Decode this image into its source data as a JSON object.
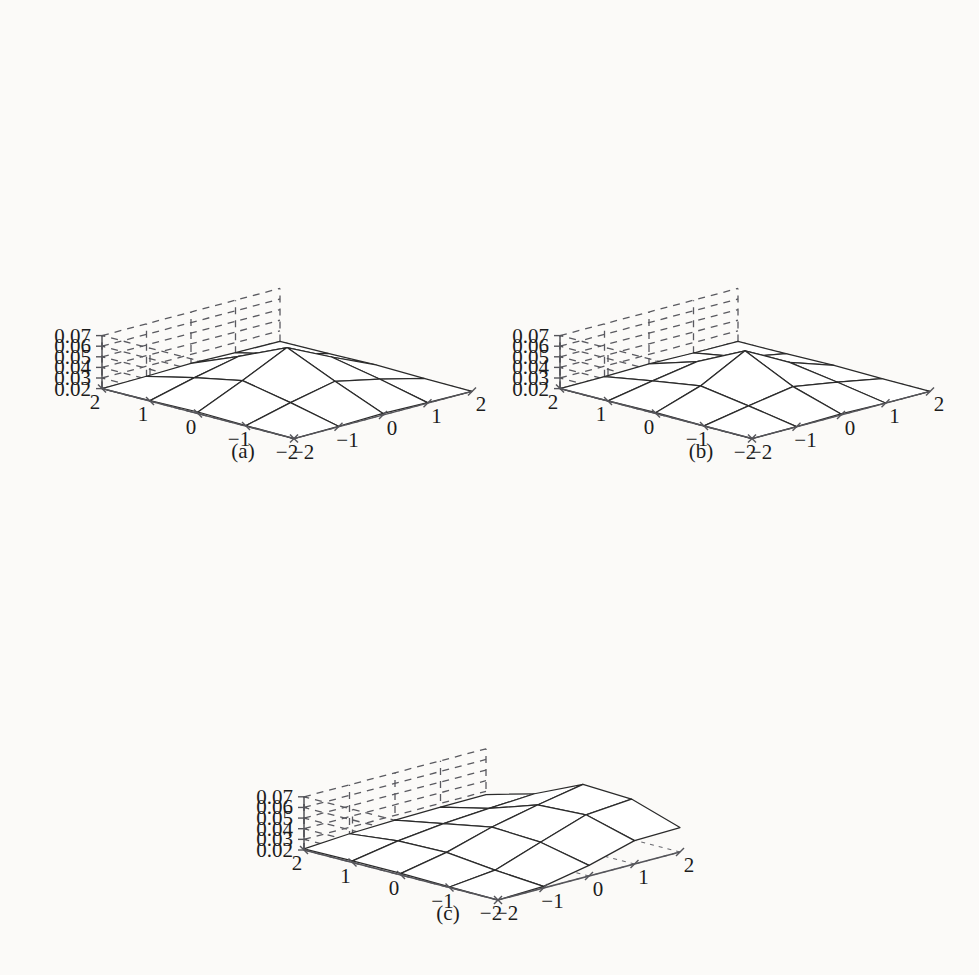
{
  "figure": {
    "background_color": "#fbfaf8",
    "line_color": "#2b2b2b",
    "axis_color": "#55555a",
    "panels": [
      "a",
      "b",
      "c"
    ]
  },
  "panels": [
    {
      "id": "a",
      "caption": "(a)",
      "z_ticks": [
        "0.07",
        "0.06",
        "0.05",
        "0.04",
        "0.03",
        "0.02"
      ],
      "x_ticks": [
        "2",
        "1",
        "0",
        "-1",
        "-2"
      ],
      "y_ticks": [
        "-2",
        "-1",
        "0",
        "1",
        "2"
      ]
    },
    {
      "id": "b",
      "caption": "(b)",
      "z_ticks": [
        "0.07",
        "0.06",
        "0.05",
        "0.04",
        "0.03",
        "0.02"
      ],
      "x_ticks": [
        "2",
        "1",
        "0",
        "-1",
        "-2"
      ],
      "y_ticks": [
        "-2",
        "-1",
        "0",
        "1",
        "2"
      ]
    },
    {
      "id": "c",
      "caption": "(c)",
      "z_ticks": [
        "0.07",
        "0.06",
        "0.05",
        "0.04",
        "0.03",
        "0.02"
      ],
      "x_ticks": [
        "2",
        "1",
        "0",
        "-1",
        "-2"
      ],
      "y_ticks": [
        "-2",
        "-1",
        "0",
        "1",
        "2"
      ]
    }
  ],
  "chart_data": [
    {
      "type": "surface",
      "panel": "a",
      "title": "(a)",
      "xlabel": "",
      "ylabel": "",
      "zlabel": "",
      "x": [
        -2,
        -1,
        0,
        1,
        2
      ],
      "y": [
        -2,
        -1,
        0,
        1,
        2
      ],
      "xlim": [
        -2,
        2
      ],
      "ylim": [
        -2,
        2
      ],
      "zlim": [
        0.02,
        0.07
      ],
      "ztick_values": [
        0.02,
        0.03,
        0.04,
        0.05,
        0.06,
        0.07
      ],
      "grid": true,
      "legend": "none",
      "z": [
        [
          0.02,
          0.0205,
          0.0215,
          0.0205,
          0.02
        ],
        [
          0.0205,
          0.031,
          0.04,
          0.031,
          0.0205
        ],
        [
          0.0215,
          0.04,
          0.06,
          0.04,
          0.0215
        ],
        [
          0.0205,
          0.031,
          0.04,
          0.031,
          0.0205
        ],
        [
          0.02,
          0.0205,
          0.0215,
          0.0205,
          0.02
        ]
      ]
    },
    {
      "type": "surface",
      "panel": "b",
      "title": "(b)",
      "xlabel": "",
      "ylabel": "",
      "zlabel": "",
      "x": [
        -2,
        -1,
        0,
        1,
        2
      ],
      "y": [
        -2,
        -1,
        0,
        1,
        2
      ],
      "xlim": [
        -2,
        2
      ],
      "ylim": [
        -2,
        2
      ],
      "zlim": [
        0.02,
        0.07
      ],
      "ztick_values": [
        0.02,
        0.03,
        0.04,
        0.05,
        0.06,
        0.07
      ],
      "grid": true,
      "legend": "none",
      "z": [
        [
          0.02,
          0.0202,
          0.021,
          0.0202,
          0.02
        ],
        [
          0.0202,
          0.028,
          0.035,
          0.028,
          0.0202
        ],
        [
          0.021,
          0.035,
          0.057,
          0.035,
          0.021
        ],
        [
          0.0202,
          0.028,
          0.035,
          0.028,
          0.0202
        ],
        [
          0.02,
          0.0202,
          0.021,
          0.0202,
          0.02
        ]
      ]
    },
    {
      "type": "surface",
      "panel": "c",
      "title": "(c)",
      "xlabel": "",
      "ylabel": "",
      "zlabel": "",
      "x": [
        -2,
        -1,
        0,
        1,
        2
      ],
      "y": [
        -2,
        -1,
        0,
        1,
        2
      ],
      "xlim": [
        -2,
        2
      ],
      "ylim": [
        -2,
        2
      ],
      "zlim": [
        0.02,
        0.07
      ],
      "ztick_values": [
        0.02,
        0.03,
        0.04,
        0.05,
        0.06,
        0.07
      ],
      "grid": true,
      "legend": "none",
      "z": [
        [
          0.02,
          0.0205,
          0.0215,
          0.0215,
          0.021
        ],
        [
          0.0215,
          0.025,
          0.03,
          0.029,
          0.024
        ],
        [
          0.03,
          0.04,
          0.0425,
          0.034,
          0.0255
        ],
        [
          0.042,
          0.0545,
          0.052,
          0.037,
          0.0265
        ],
        [
          0.043,
          0.058,
          0.06,
          0.0395,
          0.027
        ]
      ]
    }
  ]
}
